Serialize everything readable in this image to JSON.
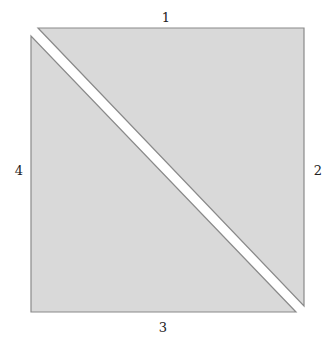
{
  "diagram": {
    "type": "dissected-square",
    "fill_color": "#d9d9d9",
    "stroke_color": "#8a8a8a",
    "shapes": [
      {
        "name": "upper-right-triangle",
        "points": [
          [
            38,
            28
          ],
          [
            304,
            28
          ],
          [
            304,
            306
          ]
        ]
      },
      {
        "name": "lower-left-triangle",
        "points": [
          [
            31,
            36
          ],
          [
            31,
            312
          ],
          [
            296,
            312
          ]
        ]
      }
    ],
    "edge_labels": {
      "top": "1",
      "right": "2",
      "bottom": "3",
      "left": "4"
    }
  }
}
